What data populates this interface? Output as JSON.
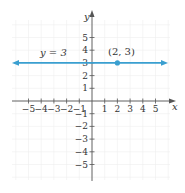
{
  "chart_data": {
    "type": "line",
    "title": "",
    "xlabel": "x",
    "ylabel": "y",
    "xlim": [
      -6,
      6
    ],
    "ylim": [
      -6,
      6
    ],
    "grid": true,
    "x_ticks": [
      -5,
      -4,
      -3,
      -2,
      -1,
      1,
      2,
      3,
      4,
      5
    ],
    "y_ticks": [
      5,
      4,
      3,
      2,
      1,
      -1,
      -2,
      -3,
      -4,
      -5
    ],
    "x_tick_labels": [
      "−5",
      "−4",
      "−3",
      "−2",
      "−1",
      "1",
      "2",
      "3",
      "4",
      "5"
    ],
    "y_tick_labels": [
      "5",
      "4",
      "3",
      "2",
      "1",
      "−1",
      "−2",
      "−3",
      "−4",
      "−5"
    ],
    "series": [
      {
        "name": "y = 3",
        "kind": "horizontal-line",
        "equation": "y = 3",
        "x": [
          -6,
          6
        ],
        "y": [
          3,
          3
        ],
        "color": "#3a9fd0",
        "arrows": "both"
      }
    ],
    "points": [
      {
        "label": "(2, 3)",
        "x": 2,
        "y": 3,
        "color": "#3a9fd0"
      }
    ],
    "annotations": [
      {
        "text": "y = 3",
        "near": "line-left"
      },
      {
        "text": "(2, 3)",
        "near": "point"
      }
    ]
  },
  "labels": {
    "x_axis": "x",
    "y_axis": "y",
    "line_label": "y = 3",
    "point_label": "(2, 3)"
  },
  "colors": {
    "line": "#3a9fd0",
    "axis": "#555555",
    "grid": "#eeeeee"
  }
}
